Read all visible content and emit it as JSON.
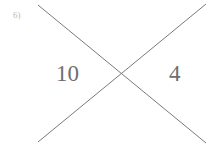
{
  "page": {
    "background_color": "#ffffff",
    "width": 209,
    "height": 146
  },
  "problem": {
    "label": "6)",
    "label_color": "#b9b9b9"
  },
  "diagram": {
    "name": "x-puzzle",
    "line_color": "#7a7a7a",
    "line_width": 1,
    "strokes": [
      {
        "name": "stroke-top-left-to-bottom-right",
        "x1": 38,
        "y1": 5,
        "x2": 206,
        "y2": 143
      },
      {
        "name": "stroke-top-right-to-bottom-left",
        "x1": 206,
        "y1": 4,
        "x2": 38,
        "y2": 142
      }
    ],
    "intersection": {
      "x": 122,
      "y": 75
    }
  },
  "cells": {
    "top": "",
    "left": "10",
    "right": "4",
    "bottom": "",
    "text_color": "#6e6e6e"
  }
}
